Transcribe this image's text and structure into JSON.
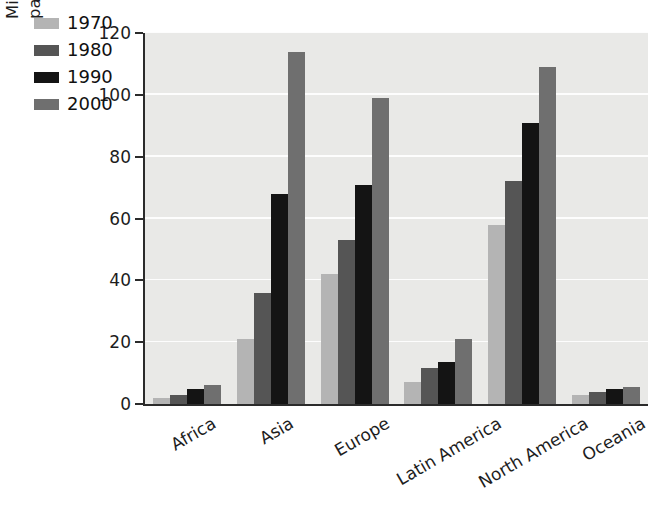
{
  "chart_data": {
    "type": "bar",
    "title": "",
    "subtitle": "",
    "xlabel": "",
    "ylabel": "Millions of tons of paper and paperboard consumed",
    "ylabel_lines": [
      "Millions of tons of paper and",
      "paperboard consumed"
    ],
    "categories": [
      "Africa",
      "Asia",
      "Europe",
      "Latin America",
      "North America",
      "Oceania"
    ],
    "series": [
      {
        "name": "1970",
        "color": "#b4b4b4",
        "values": [
          2,
          21,
          42,
          7,
          58,
          3
        ]
      },
      {
        "name": "1980",
        "color": "#555555",
        "values": [
          3,
          36,
          53,
          11.5,
          72,
          4
        ]
      },
      {
        "name": "1990",
        "color": "#141414",
        "values": [
          5,
          68,
          71,
          13.5,
          91,
          5
        ]
      },
      {
        "name": "2000",
        "color": "#6f6f6f",
        "values": [
          6,
          114,
          99,
          21,
          109,
          5.5
        ]
      }
    ],
    "ylim": [
      0,
      120
    ],
    "yticks": [
      0,
      20,
      40,
      60,
      80,
      100,
      120
    ],
    "ytick_labels": [
      "0",
      "20",
      "40",
      "60",
      "80",
      "100",
      "120"
    ],
    "grid": "horizontal",
    "grid_color": "#fdfdfd",
    "plot_background": "#e9e9e7",
    "axis_color": "#2b2b2b",
    "legend_position": "top-left",
    "legend_entries": [
      "1970",
      "1980",
      "1990",
      "2000"
    ],
    "xtick_rotation": -30
  }
}
